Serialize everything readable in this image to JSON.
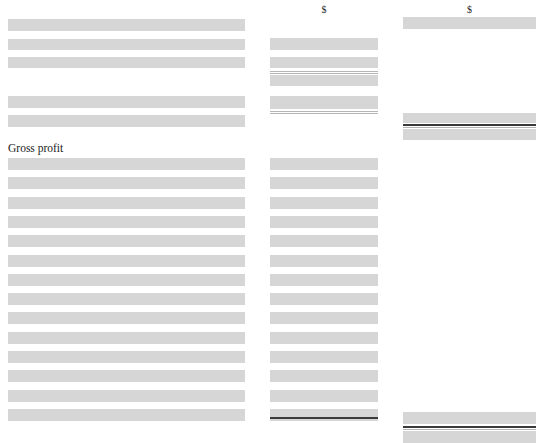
{
  "page": {
    "width": 547,
    "height": 443,
    "background": "#ffffff",
    "redaction_color": "#d6d6d6",
    "rule_color": "#9a9a9a",
    "total_rule_color": "#3a3a3a",
    "text_color": "#1b1b1b",
    "document_type": "redacted financial statement"
  },
  "columns": {
    "label_column": {
      "x": 8,
      "width": 237
    },
    "amount_column_1": {
      "x": 270,
      "width": 108,
      "currency_symbol": "$"
    },
    "amount_column_2": {
      "x": 403,
      "width": 133,
      "currency_symbol": "$"
    }
  },
  "visible_text": {
    "gross_profit_label": "Gross profit",
    "currency_header_1": "$",
    "currency_header_2": "$"
  },
  "redacted_rows": {
    "upper_block_labels": [
      {
        "y": 19,
        "h": 12
      },
      {
        "y": 39,
        "h": 11
      },
      {
        "y": 57,
        "h": 11
      }
    ],
    "upper_block_labels_2": [
      {
        "y": 96,
        "h": 12
      },
      {
        "y": 115,
        "h": 12
      }
    ],
    "upper_block_amounts_1": [
      {
        "y": 38,
        "h": 12
      },
      {
        "y": 57,
        "h": 11
      },
      {
        "y": 74,
        "h": 11
      },
      {
        "y": 95,
        "h": 13
      }
    ],
    "upper_block_amounts_2": [
      {
        "y": 17,
        "h": 12
      },
      {
        "y": 113,
        "h": 10
      },
      {
        "y": 128,
        "h": 11
      }
    ],
    "body_rows_count": 14,
    "body_row_first_y": 158,
    "body_row_pitch": 19.3,
    "body_row_height": 12,
    "footer_amounts_2": [
      {
        "y": 412,
        "h": 12
      },
      {
        "y": 431,
        "h": 12
      }
    ]
  },
  "rules": {
    "amount_column_1": [
      {
        "y": 71.5,
        "style": "hair"
      },
      {
        "y": 73.0,
        "style": "hair"
      },
      {
        "y": 110.5,
        "style": "hair"
      },
      {
        "y": 112.5,
        "style": "hair"
      },
      {
        "y": 417.0,
        "style": "dark"
      }
    ],
    "amount_column_2": [
      {
        "y": 124.0,
        "style": "dark"
      },
      {
        "y": 126.5,
        "style": "hair"
      },
      {
        "y": 426.0,
        "style": "dark"
      },
      {
        "y": 428.5,
        "style": "hair"
      }
    ]
  }
}
